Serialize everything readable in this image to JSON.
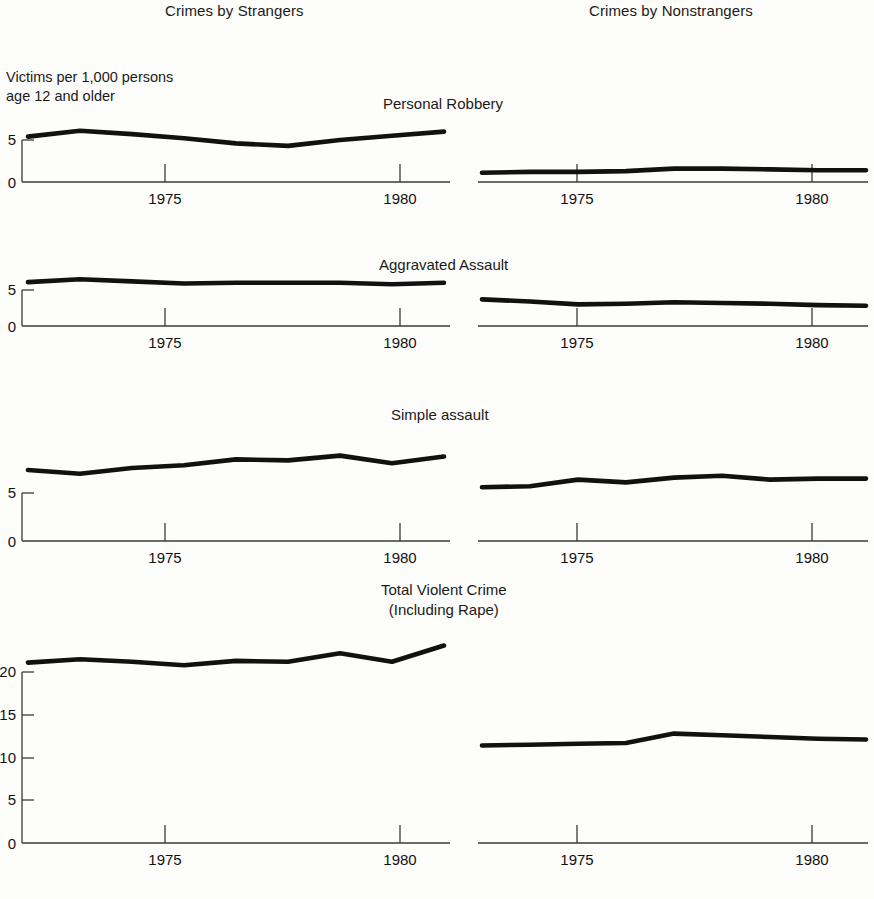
{
  "headers": {
    "left": "Crimes by Strangers",
    "right": "Crimes by Nonstrangers"
  },
  "axis_note": {
    "line1": "Victims per 1,000 persons",
    "line2": "age 12 and older"
  },
  "panels": [
    {
      "title": "Personal Robbery",
      "title_line2": ""
    },
    {
      "title": "Aggravated Assault",
      "title_line2": ""
    },
    {
      "title": "Simple assault",
      "title_line2": ""
    },
    {
      "title": "Total Violent Crime",
      "title_line2": "(Including Rape)"
    }
  ],
  "xtick_labels": [
    "1975",
    "1980"
  ],
  "ytick_labels_small": [
    "5",
    "0"
  ],
  "ytick_labels_large": [
    "20",
    "15",
    "10",
    "5",
    "0"
  ],
  "colors": {
    "line": "#111111",
    "axis": "#3a3a3a",
    "background": "#fdfdfb"
  },
  "chart_data": {
    "type": "line",
    "xlabel": "",
    "ylabel": "Victims per 1,000 persons age 12 and older",
    "grid": false,
    "legend": "none",
    "x": [
      1973,
      1974,
      1975,
      1976,
      1977,
      1978,
      1979,
      1980,
      1981
    ],
    "xlim": [
      1973,
      1981
    ],
    "xticks": [
      1975,
      1980
    ],
    "panels": [
      {
        "name": "Personal Robbery",
        "ylim": [
          0,
          8
        ],
        "yticks": [
          0,
          5
        ],
        "series": [
          {
            "name": "Crimes by Strangers",
            "values": [
              5.4,
              6.1,
              5.7,
              5.2,
              4.6,
              4.3,
              5.0,
              5.5,
              6.0
            ]
          },
          {
            "name": "Crimes by Nonstrangers",
            "values": [
              1.1,
              1.2,
              1.2,
              1.3,
              1.6,
              1.6,
              1.5,
              1.4,
              1.4
            ]
          }
        ]
      },
      {
        "name": "Aggravated Assault",
        "ylim": [
          0,
          8
        ],
        "yticks": [
          0,
          5
        ],
        "series": [
          {
            "name": "Crimes by Strangers",
            "values": [
              6.1,
              6.5,
              6.2,
              5.9,
              6.0,
              6.0,
              6.0,
              5.8,
              6.0
            ]
          },
          {
            "name": "Crimes by Nonstrangers",
            "values": [
              3.7,
              3.4,
              3.0,
              3.1,
              3.3,
              3.2,
              3.1,
              2.9,
              2.8
            ]
          }
        ]
      },
      {
        "name": "Simple assault",
        "ylim": [
          0,
          12
        ],
        "yticks": [
          0,
          5
        ],
        "series": [
          {
            "name": "Crimes by Strangers",
            "values": [
              7.4,
              7.0,
              7.6,
              7.9,
              8.5,
              8.4,
              8.9,
              8.1,
              8.8
            ]
          },
          {
            "name": "Crimes by Nonstrangers",
            "values": [
              5.6,
              5.7,
              6.4,
              6.1,
              6.6,
              6.8,
              6.4,
              6.5,
              6.5
            ]
          }
        ]
      },
      {
        "name": "Total Violent Crime (Including Rape)",
        "ylim": [
          0,
          24
        ],
        "yticks": [
          0,
          5,
          10,
          15,
          20
        ],
        "series": [
          {
            "name": "Crimes by Strangers",
            "values": [
              21.1,
              21.5,
              21.2,
              20.8,
              21.3,
              21.2,
              22.2,
              21.2,
              23.1
            ]
          },
          {
            "name": "Crimes by Nonstrangers",
            "values": [
              11.4,
              11.5,
              11.6,
              11.7,
              12.8,
              12.6,
              12.4,
              12.2,
              12.1
            ]
          }
        ]
      }
    ]
  }
}
